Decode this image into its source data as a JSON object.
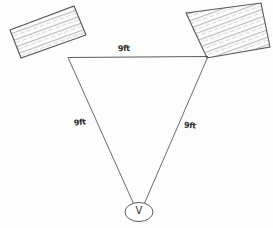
{
  "diagram": {
    "background_color": "#fdfdfd",
    "ink_color": "#4a4a4a",
    "label_color": "#2b2b2b",
    "measurements": {
      "top_side": "9ft",
      "left_side": "9ft",
      "right_side": "9ft"
    },
    "vertex": {
      "letter": "V",
      "shape": "ellipse"
    },
    "shapes": {
      "left_rectangle": {
        "name": "hatched-rectangle-left",
        "fill": "diagonal-hatch",
        "points": "10,30 74,6 86,35 21,58"
      },
      "right_rectangle": {
        "name": "hatched-rectangle-right",
        "fill": "diagonal-hatch",
        "points": "186,13 261,3 270,47 207,58"
      }
    },
    "triangle": {
      "left_vertex": "68,57",
      "right_vertex": "208,57",
      "bottom_vertex": "138,210"
    }
  }
}
